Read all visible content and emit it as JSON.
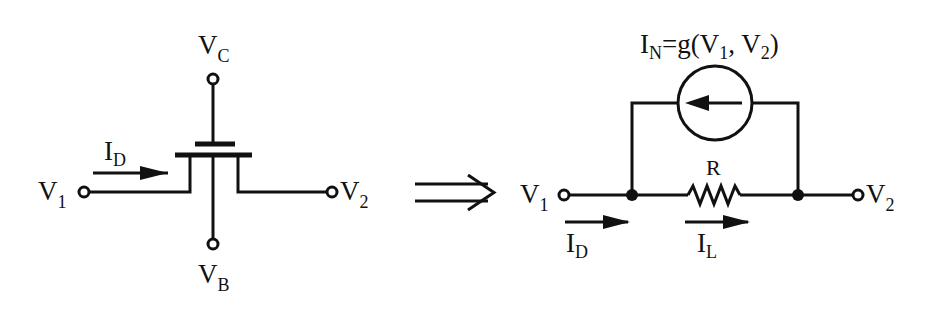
{
  "diagram": {
    "left_circuit": {
      "title": "Transistor device",
      "labels": {
        "gate": {
          "main": "V",
          "sub": "C"
        },
        "bulk": {
          "main": "V",
          "sub": "B"
        },
        "source": {
          "main": "V",
          "sub": "1"
        },
        "drain": {
          "main": "V",
          "sub": "2"
        },
        "current": {
          "main": "I",
          "sub": "D"
        }
      }
    },
    "transform_arrow": "⇒",
    "right_circuit": {
      "title": "Equivalent circuit",
      "current_source_label": {
        "main": "I",
        "sub": "N",
        "expr_a": "=g(V",
        "sub1": "1",
        "expr_b": ", V",
        "sub2": "2",
        "expr_c": ")"
      },
      "resistor_label": "R",
      "labels": {
        "left_terminal": {
          "main": "V",
          "sub": "1"
        },
        "right_terminal": {
          "main": "V",
          "sub": "2"
        },
        "input_current": {
          "main": "I",
          "sub": "D"
        },
        "load_current": {
          "main": "I",
          "sub": "L"
        }
      }
    },
    "colors": {
      "ink": "#111111",
      "background": "#ffffff"
    }
  }
}
